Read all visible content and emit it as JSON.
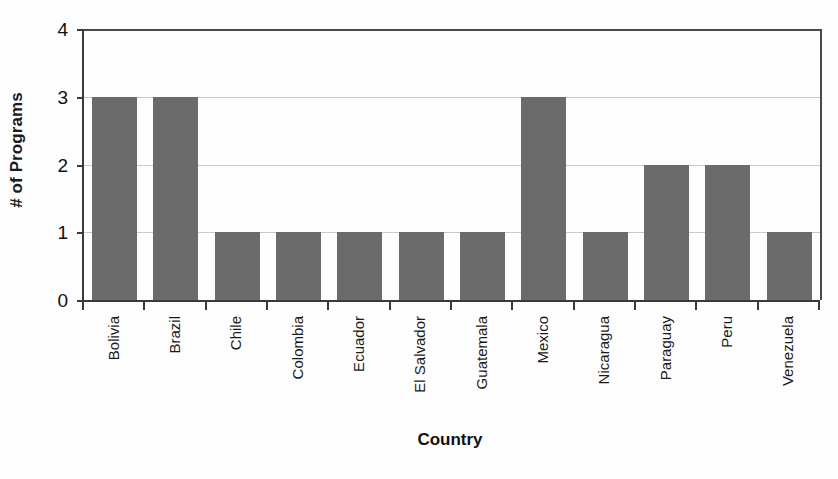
{
  "chart_data": {
    "type": "bar",
    "title": "",
    "xlabel": "Country",
    "ylabel": "# of Programs",
    "categories": [
      "Bolivia",
      "Brazil",
      "Chile",
      "Colombia",
      "Ecuador",
      "El Salvador",
      "Guatemala",
      "Mexico",
      "Nicaragua",
      "Paraguay",
      "Peru",
      "Venezuela"
    ],
    "values": [
      3,
      3,
      1,
      1,
      1,
      1,
      1,
      3,
      1,
      2,
      2,
      1
    ],
    "ylim": [
      0,
      4
    ],
    "ytick_labels": [
      "0",
      "1",
      "2",
      "3",
      "4"
    ],
    "ytick_values": [
      0,
      1,
      2,
      3,
      4
    ],
    "grid": true,
    "legend": "none",
    "bar_color": "#6b6b6b",
    "gridline_color": "#c9c9c9",
    "axis_color": "#3a3a3a",
    "background_color": "#fdfdfd"
  }
}
